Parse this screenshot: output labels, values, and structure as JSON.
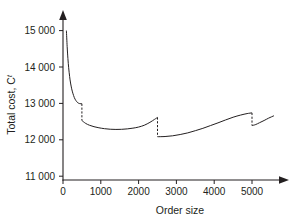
{
  "chart_data": {
    "type": "line",
    "title": "",
    "xlabel": "Order size",
    "ylabel": "Total cost, C",
    "ylabel_superscript": "t",
    "xlim": [
      0,
      5750
    ],
    "ylim": [
      11000,
      15200
    ],
    "grid": false,
    "legend": null,
    "x_ticks": [
      0,
      1000,
      2000,
      3000,
      4000,
      5000
    ],
    "x_tick_labels": [
      "0",
      "1000",
      "2000",
      "3000",
      "4000",
      "5000"
    ],
    "y_ticks": [
      11000,
      12000,
      13000,
      14000,
      15000
    ],
    "y_tick_labels": [
      "11 000",
      "12 000",
      "13 000",
      "14 000",
      "15 000"
    ],
    "breakpoints": [
      500,
      2500,
      5000
    ],
    "series": [
      {
        "name": "Total cost",
        "segments": [
          {
            "name": "segment-1",
            "x_start": 90,
            "x_end": 500,
            "y_start": 15000,
            "y_end": 12990,
            "points": [
              [
                90,
                15000
              ],
              [
                110,
                14560
              ],
              [
                130,
                14230
              ],
              [
                150,
                13980
              ],
              [
                175,
                13740
              ],
              [
                200,
                13560
              ],
              [
                230,
                13400
              ],
              [
                260,
                13280
              ],
              [
                300,
                13160
              ],
              [
                340,
                13080
              ],
              [
                390,
                13020
              ],
              [
                440,
                12995
              ],
              [
                500,
                12990
              ]
            ]
          },
          {
            "name": "segment-2",
            "x_start": 500,
            "x_end": 2500,
            "y_start": 12530,
            "y_end": 12615,
            "points": [
              [
                500,
                12530
              ],
              [
                600,
                12450
              ],
              [
                700,
                12400
              ],
              [
                820,
                12360
              ],
              [
                950,
                12330
              ],
              [
                1100,
                12305
              ],
              [
                1250,
                12290
              ],
              [
                1400,
                12285
              ],
              [
                1550,
                12288
              ],
              [
                1700,
                12300
              ],
              [
                1850,
                12320
              ],
              [
                2000,
                12350
              ],
              [
                2150,
                12400
              ],
              [
                2300,
                12480
              ],
              [
                2420,
                12560
              ],
              [
                2500,
                12615
              ]
            ]
          },
          {
            "name": "segment-3",
            "x_start": 2500,
            "x_end": 5000,
            "y_start": 12085,
            "y_end": 12740,
            "points": [
              [
                2500,
                12085
              ],
              [
                2700,
                12090
              ],
              [
                2900,
                12110
              ],
              [
                3100,
                12145
              ],
              [
                3300,
                12190
              ],
              [
                3500,
                12250
              ],
              [
                3700,
                12315
              ],
              [
                3900,
                12390
              ],
              [
                4100,
                12465
              ],
              [
                4300,
                12545
              ],
              [
                4500,
                12620
              ],
              [
                4700,
                12680
              ],
              [
                4870,
                12720
              ],
              [
                5000,
                12740
              ]
            ]
          },
          {
            "name": "segment-4",
            "x_start": 5000,
            "x_end": 5580,
            "y_start": 12390,
            "y_end": 12660,
            "points": [
              [
                5000,
                12390
              ],
              [
                5100,
                12420
              ],
              [
                5200,
                12470
              ],
              [
                5320,
                12530
              ],
              [
                5440,
                12595
              ],
              [
                5580,
                12660
              ]
            ]
          }
        ],
        "drops": [
          {
            "x": 500,
            "y_from": 12990,
            "y_to": 12530
          },
          {
            "x": 2500,
            "y_from": 12615,
            "y_to": 12085
          },
          {
            "x": 5000,
            "y_from": 12740,
            "y_to": 12390
          }
        ]
      }
    ],
    "colors": {
      "curve": "#231f20",
      "axis": "#231f20",
      "background": "#ffffff"
    }
  }
}
